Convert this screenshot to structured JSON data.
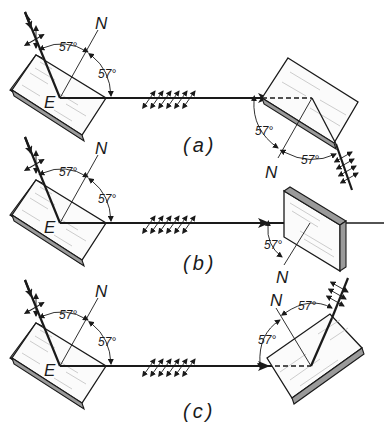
{
  "figure": {
    "panels": [
      {
        "id": "a",
        "caption": "(a)",
        "point_label": "E",
        "normal_label_left": "N",
        "normal_label_right": "N",
        "angle_incidence": "57°",
        "angle_reflection": "57°",
        "angle_second_incidence": "57°",
        "angle_second_reflection": "57°"
      },
      {
        "id": "b",
        "caption": "(b)",
        "point_label": "E",
        "normal_label_left": "N",
        "normal_label_right": "N",
        "angle_incidence": "57°",
        "angle_reflection": "57°",
        "angle_second_incidence": "57°"
      },
      {
        "id": "c",
        "caption": "(c)",
        "point_label": "E",
        "normal_label_left": "N",
        "normal_label_right": "N",
        "angle_incidence": "57°",
        "angle_reflection": "57°",
        "angle_second_incidence": "57°",
        "angle_second_reflection": "57°"
      }
    ]
  }
}
